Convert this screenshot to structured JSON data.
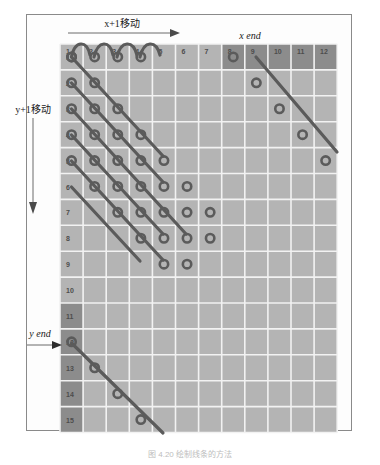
{
  "figure": {
    "caption": "图 4.20    绘制线条的方法",
    "colors": {
      "grid_fill": "#b4b4b4",
      "grid_fill_dark": "#8c8c8c",
      "grid_line": "#f2f2f2",
      "frame_border": "#8a8a8a",
      "path_stroke": "#5b5b5b",
      "background": "#fdfdfd",
      "label_text": "#1a1a1a",
      "cell_text": "#4d4d4d"
    }
  },
  "labels": {
    "x_move": "x+1移动",
    "y_move": "y+1移动",
    "x_end": "x end",
    "y_end": "y end"
  },
  "grid": {
    "columns": 12,
    "rows": 15,
    "column_headers": [
      "1",
      "2",
      "3",
      "4",
      "5",
      "6",
      "7",
      "8",
      "9",
      "10",
      "11",
      "12"
    ],
    "row_headers": [
      "1",
      "2",
      "3",
      "4",
      "5",
      "6",
      "7",
      "8",
      "9",
      "10",
      "11",
      "12",
      "13",
      "14",
      "15"
    ],
    "dark_columns": [
      "8",
      "9",
      "10",
      "11",
      "12"
    ],
    "dark_rows": [
      "11",
      "12",
      "13",
      "14",
      "15"
    ],
    "origin_x": 60,
    "origin_y": 44,
    "cell_width": 23.1,
    "cell_height": 25.9
  },
  "chart_data": {
    "type": "line",
    "xlabel": "x",
    "ylabel": "y",
    "xlim": [
      1,
      12
    ],
    "ylim": [
      1,
      15
    ],
    "grid": true,
    "legend": "none",
    "annotations": [
      "x+1移动",
      "y+1移动",
      "x end",
      "y end"
    ],
    "series": [
      {
        "name": "arc-path-row-1",
        "kind": "arcs",
        "points": [
          [
            1,
            1
          ],
          [
            2,
            1
          ],
          [
            3,
            1
          ],
          [
            4,
            1
          ]
        ]
      },
      {
        "name": "diagonal-1",
        "points": [
          [
            1,
            1
          ],
          [
            2,
            2
          ],
          [
            3,
            3
          ],
          [
            4,
            4
          ],
          [
            5,
            5
          ],
          [
            6,
            6
          ],
          [
            7,
            7
          ]
        ]
      },
      {
        "name": "diagonal-2",
        "points": [
          [
            1,
            2
          ],
          [
            2,
            3
          ],
          [
            3,
            4
          ],
          [
            4,
            5
          ],
          [
            5,
            6
          ],
          [
            6,
            7
          ],
          [
            7,
            8
          ]
        ]
      },
      {
        "name": "diagonal-3",
        "points": [
          [
            1,
            3
          ],
          [
            2,
            4
          ],
          [
            3,
            5
          ],
          [
            4,
            6
          ],
          [
            5,
            7
          ],
          [
            6,
            8
          ]
        ]
      },
      {
        "name": "diagonal-4",
        "points": [
          [
            1,
            4
          ],
          [
            2,
            5
          ],
          [
            3,
            6
          ],
          [
            4,
            7
          ],
          [
            5,
            8
          ],
          [
            6,
            9
          ]
        ]
      },
      {
        "name": "diagonal-5",
        "points": [
          [
            1,
            5
          ],
          [
            2,
            6
          ],
          [
            3,
            7
          ],
          [
            4,
            8
          ],
          [
            5,
            9
          ]
        ]
      },
      {
        "name": "diagonal-long-right",
        "points": [
          [
            8,
            1
          ],
          [
            9,
            2
          ],
          [
            10,
            3
          ],
          [
            11,
            4
          ],
          [
            12,
            5
          ]
        ]
      },
      {
        "name": "diagonal-bottom",
        "points": [
          [
            1,
            12
          ],
          [
            2,
            13
          ],
          [
            3,
            14
          ],
          [
            4,
            15
          ]
        ]
      }
    ]
  }
}
